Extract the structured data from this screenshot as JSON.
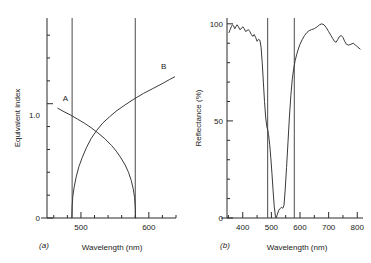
{
  "figure": {
    "panel_a_label": "(a)",
    "panel_b_label": "(b)"
  },
  "chart_data": [
    {
      "type": "line",
      "panel": "(a)",
      "title": "",
      "xlabel": "Wavelength (nm)",
      "ylabel": "Equivalent index",
      "xlim": [
        450,
        640
      ],
      "ylim": [
        0,
        1.75
      ],
      "xticks": [
        500,
        600
      ],
      "xticklabels": [
        "500",
        "600"
      ],
      "x_minor_step": 20,
      "yticks": [
        0,
        1.0
      ],
      "yticklabels": [
        "0",
        "1.0"
      ],
      "y_minor_step": 0.2,
      "grid": false,
      "legend": "none",
      "annotations": [
        {
          "text": "A",
          "x": 477,
          "y": 1.02
        },
        {
          "text": "B",
          "x": 622,
          "y": 1.3
        }
      ],
      "vertical_lines": [
        487,
        580
      ],
      "series": [
        {
          "name": "A",
          "label": "A",
          "points": [
            [
              466,
              0.96
            ],
            [
              475,
              0.93
            ],
            [
              485,
              0.9
            ],
            [
              495,
              0.865
            ],
            [
              505,
              0.83
            ],
            [
              515,
              0.79
            ],
            [
              525,
              0.745
            ],
            [
              535,
              0.695
            ],
            [
              545,
              0.635
            ],
            [
              552,
              0.585
            ],
            [
              559,
              0.525
            ],
            [
              565,
              0.465
            ],
            [
              570,
              0.4
            ],
            [
              574,
              0.33
            ],
            [
              577,
              0.255
            ],
            [
              579,
              0.18
            ],
            [
              580,
              0.1
            ],
            [
              580.5,
              0.0
            ]
          ]
        },
        {
          "name": "B",
          "label": "B",
          "points": [
            [
              486.5,
              0.0
            ],
            [
              487,
              0.1
            ],
            [
              488,
              0.19
            ],
            [
              490,
              0.27
            ],
            [
              493,
              0.36
            ],
            [
              497,
              0.45
            ],
            [
              502,
              0.53
            ],
            [
              508,
              0.615
            ],
            [
              515,
              0.695
            ],
            [
              523,
              0.765
            ],
            [
              532,
              0.83
            ],
            [
              542,
              0.885
            ],
            [
              553,
              0.94
            ],
            [
              565,
              0.99
            ],
            [
              578,
              1.04
            ],
            [
              592,
              1.09
            ],
            [
              605,
              1.13
            ],
            [
              618,
              1.17
            ],
            [
              630,
              1.21
            ],
            [
              638,
              1.235
            ]
          ]
        }
      ]
    },
    {
      "type": "line",
      "panel": "(b)",
      "title": "",
      "xlabel": "Wavelength (nm)",
      "ylabel": "Reflectance (%)",
      "xlim": [
        345,
        820
      ],
      "ylim": [
        0,
        103
      ],
      "xticks": [
        400,
        500,
        600,
        700,
        800
      ],
      "xticklabels": [
        "400",
        "500",
        "600",
        "700",
        "800"
      ],
      "x_minor_step": 50,
      "yticks": [
        0,
        50,
        100
      ],
      "yticklabels": [
        "0",
        "50",
        "100"
      ],
      "y_minor_step": 10,
      "grid": false,
      "legend": "none",
      "vertical_lines": [
        487,
        580
      ],
      "series": [
        {
          "name": "Reflectance",
          "label": "",
          "points": [
            [
              352,
              95.5
            ],
            [
              356,
              97.0
            ],
            [
              360,
              98.5
            ],
            [
              364,
              99.5
            ],
            [
              368,
              99.0
            ],
            [
              372,
              97.5
            ],
            [
              376,
              98.5
            ],
            [
              380,
              99.5
            ],
            [
              385,
              98.5
            ],
            [
              390,
              97.0
            ],
            [
              395,
              97.5
            ],
            [
              400,
              98.5
            ],
            [
              405,
              97.5
            ],
            [
              410,
              96.0
            ],
            [
              415,
              96.5
            ],
            [
              420,
              97.0
            ],
            [
              425,
              96.0
            ],
            [
              430,
              94.5
            ],
            [
              435,
              93.5
            ],
            [
              440,
              94.5
            ],
            [
              445,
              93.0
            ],
            [
              450,
              91.0
            ],
            [
              455,
              92.0
            ],
            [
              460,
              91.5
            ],
            [
              464,
              88.0
            ],
            [
              468,
              80.0
            ],
            [
              472,
              70.0
            ],
            [
              476,
              60.0
            ],
            [
              480,
              52.0
            ],
            [
              484,
              47.0
            ],
            [
              487,
              45.5
            ],
            [
              490,
              43.0
            ],
            [
              494,
              38.0
            ],
            [
              498,
              31.0
            ],
            [
              502,
              23.0
            ],
            [
              506,
              14.0
            ],
            [
              510,
              6.0
            ],
            [
              514,
              1.0
            ],
            [
              517,
              0.0
            ],
            [
              521,
              2.0
            ],
            [
              526,
              4.0
            ],
            [
              531,
              5.0
            ],
            [
              536,
              5.5
            ],
            [
              540,
              5.0
            ],
            [
              544,
              6.5
            ],
            [
              548,
              14.0
            ],
            [
              553,
              26.0
            ],
            [
              558,
              39.0
            ],
            [
              563,
              52.0
            ],
            [
              568,
              63.0
            ],
            [
              573,
              71.5
            ],
            [
              578,
              77.0
            ],
            [
              583,
              81.0
            ],
            [
              588,
              84.0
            ],
            [
              594,
              87.0
            ],
            [
              600,
              89.5
            ],
            [
              608,
              92.0
            ],
            [
              616,
              94.0
            ],
            [
              624,
              95.5
            ],
            [
              632,
              96.5
            ],
            [
              640,
              97.0
            ],
            [
              650,
              97.5
            ],
            [
              660,
              98.5
            ],
            [
              668,
              99.5
            ],
            [
              676,
              100.0
            ],
            [
              684,
              99.5
            ],
            [
              692,
              98.0
            ],
            [
              700,
              96.0
            ],
            [
              708,
              94.0
            ],
            [
              714,
              92.5
            ],
            [
              720,
              91.0
            ],
            [
              726,
              90.5
            ],
            [
              732,
              92.0
            ],
            [
              738,
              93.5
            ],
            [
              744,
              94.0
            ],
            [
              750,
              93.0
            ],
            [
              756,
              91.0
            ],
            [
              762,
              89.5
            ],
            [
              770,
              89.0
            ],
            [
              778,
              89.5
            ],
            [
              786,
              90.0
            ],
            [
              794,
              89.0
            ],
            [
              802,
              88.0
            ],
            [
              810,
              87.0
            ]
          ]
        }
      ]
    }
  ]
}
